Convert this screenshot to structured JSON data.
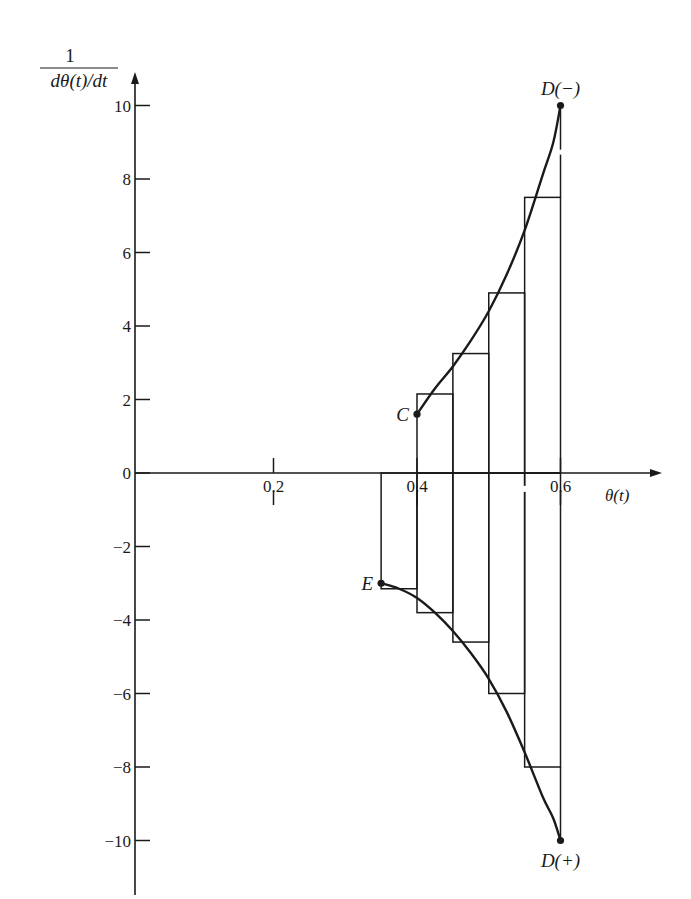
{
  "chart_data": {
    "type": "line",
    "title": "",
    "xlabel": "θ(t)",
    "ylabel_numerator": "1",
    "ylabel_denominator": "dθ(t)/dt",
    "xlim": [
      0,
      0.68
    ],
    "ylim": [
      -11,
      11
    ],
    "grid": false,
    "legend": null,
    "x_ticks": [
      {
        "value": 0.2,
        "label": "0.2"
      },
      {
        "value": 0.4,
        "label": "0.4"
      },
      {
        "value": 0.6,
        "label": "0.6"
      }
    ],
    "y_ticks": [
      {
        "value": 10,
        "label": "10"
      },
      {
        "value": 8,
        "label": "8"
      },
      {
        "value": 6,
        "label": "6"
      },
      {
        "value": 4,
        "label": "4"
      },
      {
        "value": 2,
        "label": "2"
      },
      {
        "value": 0,
        "label": "0"
      },
      {
        "value": -2,
        "label": "−2"
      },
      {
        "value": -4,
        "label": "−4"
      },
      {
        "value": -6,
        "label": "−6"
      },
      {
        "value": -8,
        "label": "−8"
      },
      {
        "value": -10,
        "label": "−10"
      }
    ],
    "series": [
      {
        "name": "upper branch C to D(−)",
        "x": [
          0.4,
          0.425,
          0.45,
          0.475,
          0.5,
          0.525,
          0.55,
          0.575,
          0.59,
          0.6
        ],
        "values": [
          1.6,
          2.3,
          2.9,
          3.6,
          4.4,
          5.4,
          6.6,
          8.1,
          9.0,
          10.0
        ]
      },
      {
        "name": "lower branch E to D(+)",
        "x": [
          0.35,
          0.375,
          0.4,
          0.425,
          0.45,
          0.475,
          0.5,
          0.525,
          0.55,
          0.575,
          0.59,
          0.6
        ],
        "values": [
          -3.0,
          -3.15,
          -3.4,
          -3.8,
          -4.3,
          -4.9,
          -5.6,
          -6.5,
          -7.6,
          -8.8,
          -9.4,
          -10.0
        ]
      }
    ],
    "step_bars_positive": [
      {
        "x0": 0.4,
        "x1": 0.45,
        "height": 2.15
      },
      {
        "x0": 0.45,
        "x1": 0.5,
        "height": 3.25
      },
      {
        "x0": 0.5,
        "x1": 0.55,
        "height": 4.9
      },
      {
        "x0": 0.55,
        "x1": 0.6,
        "height": 7.5
      }
    ],
    "step_bars_negative": [
      {
        "x0": 0.35,
        "x1": 0.4,
        "height": -3.15
      },
      {
        "x0": 0.4,
        "x1": 0.45,
        "height": -3.8
      },
      {
        "x0": 0.45,
        "x1": 0.5,
        "height": -4.6
      },
      {
        "x0": 0.5,
        "x1": 0.55,
        "height": -6.0
      },
      {
        "x0": 0.55,
        "x1": 0.6,
        "height": -8.0
      }
    ],
    "points": [
      {
        "label": "C",
        "x": 0.4,
        "y": 1.6,
        "label_pos": "left"
      },
      {
        "label": "D(−)",
        "x": 0.6,
        "y": 10.0,
        "label_pos": "above"
      },
      {
        "label": "E",
        "x": 0.35,
        "y": -3.0,
        "label_pos": "left"
      },
      {
        "label": "D(+)",
        "x": 0.6,
        "y": -10.0,
        "label_pos": "below"
      }
    ]
  }
}
